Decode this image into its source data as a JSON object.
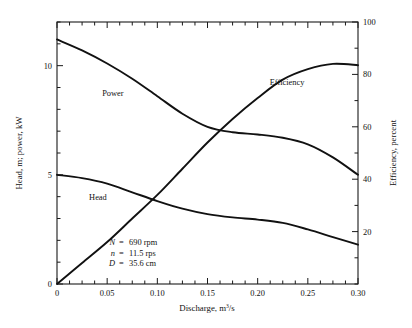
{
  "chart_data": {
    "type": "line",
    "title": "",
    "xlabel": "Discharge, m³/s",
    "ylabel_left": "Head, m; power, kW",
    "ylabel_right": "Efficiency, percent",
    "xlim": [
      0,
      0.3
    ],
    "ylim_left": [
      0,
      12
    ],
    "ylim_right": [
      0,
      100
    ],
    "grid": false,
    "legend": "inline-curve-labels",
    "xticks": [
      "0",
      "0.05",
      "0.10",
      "0.15",
      "0.20",
      "0.25",
      "0.30"
    ],
    "xtick_values": [
      0,
      0.05,
      0.1,
      0.15,
      0.2,
      0.25,
      0.3
    ],
    "xminor_step": 0.0125,
    "yticks_left": [
      "0",
      "5",
      "10"
    ],
    "ytick_values_left": [
      0,
      5,
      10
    ],
    "yminor_step_left": 1,
    "yticks_right": [
      "20",
      "40",
      "60",
      "80",
      "100"
    ],
    "ytick_values_right": [
      20,
      40,
      60,
      80,
      100
    ],
    "yminor_step_right": 10,
    "series": [
      {
        "name": "Power",
        "axis": "left",
        "unit": "kW",
        "label_x": 0.045,
        "label_y": 8.6,
        "x": [
          0,
          0.025,
          0.05,
          0.075,
          0.1,
          0.125,
          0.15,
          0.175,
          0.2,
          0.225,
          0.25,
          0.275,
          0.3
        ],
        "values": [
          11.2,
          10.7,
          10.1,
          9.4,
          8.6,
          7.8,
          7.2,
          6.95,
          6.85,
          6.7,
          6.4,
          5.8,
          5.0
        ]
      },
      {
        "name": "Head",
        "axis": "left",
        "unit": "m",
        "label_x": 0.032,
        "label_y": 3.85,
        "x": [
          0,
          0.025,
          0.05,
          0.075,
          0.1,
          0.125,
          0.15,
          0.175,
          0.2,
          0.225,
          0.25,
          0.275,
          0.3
        ],
        "values": [
          5.0,
          4.85,
          4.6,
          4.2,
          3.8,
          3.45,
          3.2,
          3.05,
          2.95,
          2.8,
          2.5,
          2.15,
          1.8
        ]
      },
      {
        "name": "Efficiency",
        "axis": "right",
        "unit": "percent",
        "label_x": 0.212,
        "label_y": 76,
        "x": [
          0,
          0.025,
          0.05,
          0.075,
          0.1,
          0.125,
          0.15,
          0.175,
          0.2,
          0.225,
          0.25,
          0.275,
          0.3
        ],
        "values": [
          0,
          8,
          16,
          25,
          34,
          44,
          54,
          63,
          71,
          78,
          82,
          84,
          83.5
        ]
      }
    ],
    "annotations": [
      {
        "symbol": "N",
        "equals": "=",
        "value": "690 rpm"
      },
      {
        "symbol": "n",
        "equals": "=",
        "value": "11.5 rps"
      },
      {
        "symbol": "D",
        "equals": "=",
        "value": "35.6 cm"
      }
    ]
  }
}
